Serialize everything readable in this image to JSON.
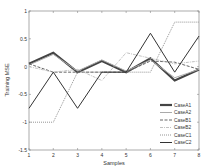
{
  "chart_data": {
    "type": "line",
    "title": "",
    "xlabel": "Samples",
    "ylabel": "Training MSE",
    "x": [
      1,
      2,
      3,
      4,
      5,
      6,
      7,
      8
    ],
    "xlim": [
      1,
      8
    ],
    "ylim": [
      -1.5,
      1
    ],
    "xticks": [
      "1",
      "2",
      "3",
      "4",
      "5",
      "6",
      "7",
      "8"
    ],
    "yticks": [
      1,
      0.5,
      0,
      -0.5,
      -1,
      -1.5
    ],
    "ytick_labels": [
      "1",
      "0.5",
      "0",
      "-0.5",
      "-1",
      "-1.5"
    ],
    "grid": false,
    "legend_position": "bottom-right",
    "series": [
      {
        "name": "CaseA1",
        "style": "thick-solid",
        "color": "#444444",
        "values": [
          0.05,
          0.25,
          -0.1,
          0.1,
          -0.1,
          0.15,
          -0.25,
          -0.05
        ]
      },
      {
        "name": "CaseA2",
        "style": "solid",
        "color": "#aaaaaa",
        "values": [
          0.03,
          0.22,
          -0.08,
          0.12,
          -0.08,
          0.12,
          -0.2,
          -0.05
        ]
      },
      {
        "name": "CaseB1",
        "style": "dashed",
        "color": "#666666",
        "values": [
          0.05,
          -0.1,
          -0.1,
          -0.1,
          -0.1,
          0.1,
          0.08,
          -0.05
        ]
      },
      {
        "name": "CaseB2",
        "style": "dash-dot",
        "color": "#bbbbbb",
        "values": [
          0.0,
          -0.1,
          -0.05,
          -0.25,
          0.25,
          0.15,
          0.05,
          0.1
        ]
      },
      {
        "name": "CaseC1",
        "style": "dotted",
        "color": "#888888",
        "values": [
          -1.0,
          -1.0,
          -0.1,
          -0.1,
          -0.1,
          -0.1,
          0.8,
          0.8
        ]
      },
      {
        "name": "CaseC2",
        "style": "solid",
        "color": "#333333",
        "values": [
          -0.75,
          -0.1,
          -0.75,
          -0.1,
          -0.1,
          0.6,
          -0.1,
          0.55
        ]
      }
    ]
  }
}
